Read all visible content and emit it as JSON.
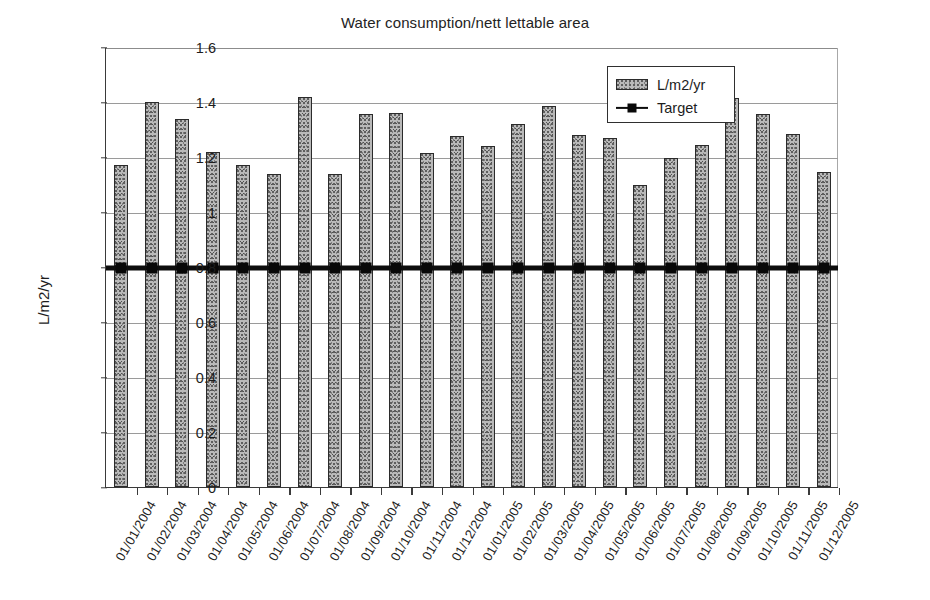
{
  "chart_data": {
    "type": "bar",
    "title": "Water consumption/nett lettable area",
    "xlabel": "",
    "ylabel": "L/m2/yr",
    "ylim": [
      0,
      1.6
    ],
    "ytick_labels": [
      "1.6",
      "1.4",
      "1.2",
      "1",
      "0.8",
      "0.6",
      "0.4",
      "0.2",
      "0"
    ],
    "ytick_values": [
      1.6,
      1.4,
      1.2,
      1.0,
      0.8,
      0.6,
      0.4,
      0.2,
      0
    ],
    "grid": true,
    "legend_position": "top-right-inside",
    "categories": [
      "01/01/2004",
      "01/02/2004",
      "01/03/2004",
      "01/04/2004",
      "01/05/2004",
      "01/06/2004",
      "01/07/2004",
      "01/08/2004",
      "01/09/2004",
      "01/10/2004",
      "01/11/2004",
      "01/12/2004",
      "01/01/2005",
      "01/02/2005",
      "01/03/2005",
      "01/04/2005",
      "01/05/2005",
      "01/06/2005",
      "01/07/2005",
      "01/08/2005",
      "01/09/2005",
      "01/10/2005",
      "01/11/2005",
      "01/12/2005"
    ],
    "series": [
      {
        "name": "L/m2/yr",
        "type": "bar",
        "color": "#b9b9b9",
        "values": [
          1.17,
          1.4,
          1.34,
          1.22,
          1.17,
          1.14,
          1.42,
          1.14,
          1.355,
          1.36,
          1.215,
          1.275,
          1.24,
          1.32,
          1.385,
          1.28,
          1.27,
          1.1,
          1.195,
          1.245,
          1.415,
          1.355,
          1.285,
          1.145
        ]
      },
      {
        "name": "Target",
        "type": "line",
        "color": "#0d0d0d",
        "marker": "square",
        "constant_value": 0.8,
        "values": [
          0.8,
          0.8,
          0.8,
          0.8,
          0.8,
          0.8,
          0.8,
          0.8,
          0.8,
          0.8,
          0.8,
          0.8,
          0.8,
          0.8,
          0.8,
          0.8,
          0.8,
          0.8,
          0.8,
          0.8,
          0.8,
          0.8,
          0.8,
          0.8
        ]
      }
    ]
  },
  "legend": {
    "entries": [
      {
        "label": "L/m2/yr",
        "swatch": "bar"
      },
      {
        "label": "Target",
        "swatch": "line-marker"
      }
    ]
  }
}
